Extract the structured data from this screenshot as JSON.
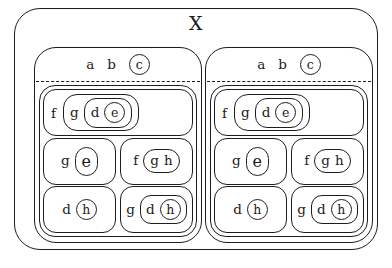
{
  "figure": {
    "type": "nested-set-diagram",
    "universe_label": "X",
    "separator_style": "dashed",
    "stroke_color": "#1d1d1d",
    "background_color": "#ffffff",
    "panel_count": 2,
    "panels_identical": true
  },
  "panel": {
    "header": {
      "plain_atoms": [
        "a",
        "b"
      ],
      "circled_atom": "c"
    },
    "rows": [
      {
        "name": "row-f-g-d-e",
        "outer_label": "f",
        "nest": [
          "g",
          "d",
          "e"
        ],
        "innermost_circled": "e"
      },
      {
        "name": "row-ge-fgh",
        "cells": [
          {
            "name": "cell-g-e",
            "outer_label": "g",
            "circled": "e"
          },
          {
            "name": "cell-f-gh",
            "outer_label": "f",
            "group": [
              "g",
              "h"
            ]
          }
        ]
      },
      {
        "name": "row-dh-gdh",
        "cells": [
          {
            "name": "cell-d-h",
            "outer_label": "d",
            "circled": "h"
          },
          {
            "name": "cell-g-d-h",
            "outer_label": "g",
            "middle": "d",
            "circled": "h"
          }
        ]
      }
    ]
  },
  "atoms": {
    "a": "a",
    "b": "b",
    "c": "c",
    "d": "d",
    "e": "e",
    "f": "f",
    "g": "g",
    "h": "h"
  }
}
